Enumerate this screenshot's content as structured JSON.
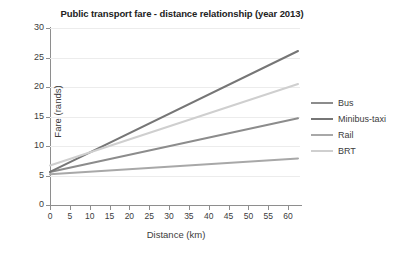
{
  "chart_data": {
    "type": "line",
    "title": "Public transport fare - distance relationship (year 2013)",
    "xlabel": "Distance (km)",
    "ylabel": "Fare (rands)",
    "xlim": [
      0,
      63
    ],
    "ylim": [
      0,
      30
    ],
    "xticks": [
      0,
      5,
      10,
      15,
      20,
      25,
      30,
      35,
      40,
      45,
      50,
      55,
      60
    ],
    "yticks": [
      0,
      5,
      10,
      15,
      20,
      25,
      30
    ],
    "grid": true,
    "legend_position": "right",
    "x": [
      0,
      62.5
    ],
    "series": [
      {
        "name": "Bus",
        "color": "#8c8c8c",
        "values": [
          5.6,
          14.7
        ]
      },
      {
        "name": "Minibus-taxi",
        "color": "#767676",
        "values": [
          5.6,
          26.1
        ]
      },
      {
        "name": "Rail",
        "color": "#a8a8a8",
        "values": [
          5.2,
          7.9
        ]
      },
      {
        "name": "BRT",
        "color": "#cfcfcf",
        "values": [
          6.7,
          20.5
        ]
      }
    ]
  },
  "legend": {
    "items": [
      {
        "label": "Bus"
      },
      {
        "label": "Minibus-taxi"
      },
      {
        "label": "Rail"
      },
      {
        "label": "BRT"
      }
    ]
  },
  "colors": {
    "axis": "#8e8e8e",
    "grid": "#ececec",
    "text": "#3c3c3c",
    "title": "#222222",
    "background": "#ffffff"
  }
}
